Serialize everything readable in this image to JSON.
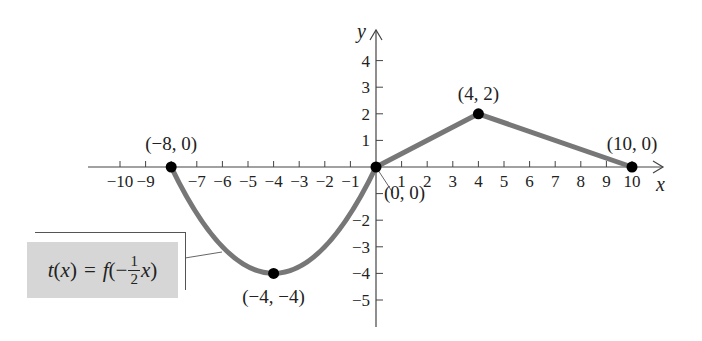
{
  "chart_data": {
    "type": "line",
    "title": "",
    "xlabel": "x",
    "ylabel": "y",
    "xlim": [
      -10,
      10
    ],
    "ylim": [
      -5,
      4
    ],
    "x_ticks": [
      -10,
      -9,
      -8,
      -7,
      -6,
      -5,
      -4,
      -3,
      -2,
      -1,
      1,
      2,
      3,
      4,
      5,
      6,
      7,
      8,
      9,
      10
    ],
    "x_tick_labels": [
      "−10",
      "−9",
      "",
      "−7",
      "−6",
      "−5",
      "−4",
      "−3",
      "−2",
      "−1",
      "1",
      "2",
      "3",
      "4",
      "5",
      "6",
      "7",
      "8",
      "9",
      "10"
    ],
    "y_ticks": [
      -5,
      -4,
      -3,
      -2,
      -1,
      1,
      2,
      3,
      4
    ],
    "y_tick_labels": [
      "−5",
      "−4",
      "−3",
      "−2",
      "",
      "1",
      "2",
      "3",
      "4"
    ],
    "grid": false,
    "series": [
      {
        "name": "t(x) = f(−½x)",
        "segments": [
          {
            "shape": "parabola",
            "points": [
              [
                -8,
                0
              ],
              [
                -4,
                -4
              ],
              [
                0,
                0
              ]
            ]
          },
          {
            "shape": "line",
            "points": [
              [
                0,
                0
              ],
              [
                4,
                2
              ]
            ]
          },
          {
            "shape": "line",
            "points": [
              [
                4,
                2
              ],
              [
                10,
                0
              ]
            ]
          }
        ],
        "color": "#777777"
      }
    ],
    "key_points": [
      {
        "x": -8,
        "y": 0,
        "label": "(−8, 0)"
      },
      {
        "x": -4,
        "y": -4,
        "label": "(−4, −4)"
      },
      {
        "x": 0,
        "y": 0,
        "label": "(0, 0)"
      },
      {
        "x": 4,
        "y": 2,
        "label": "(4, 2)"
      },
      {
        "x": 10,
        "y": 0,
        "label": "(10, 0)"
      }
    ],
    "annotation": {
      "function_name": "t",
      "argument": "x",
      "equals": "=",
      "outer": "f",
      "sign": "−",
      "frac_num": "1",
      "frac_den": "2",
      "inner_var": "x"
    }
  }
}
